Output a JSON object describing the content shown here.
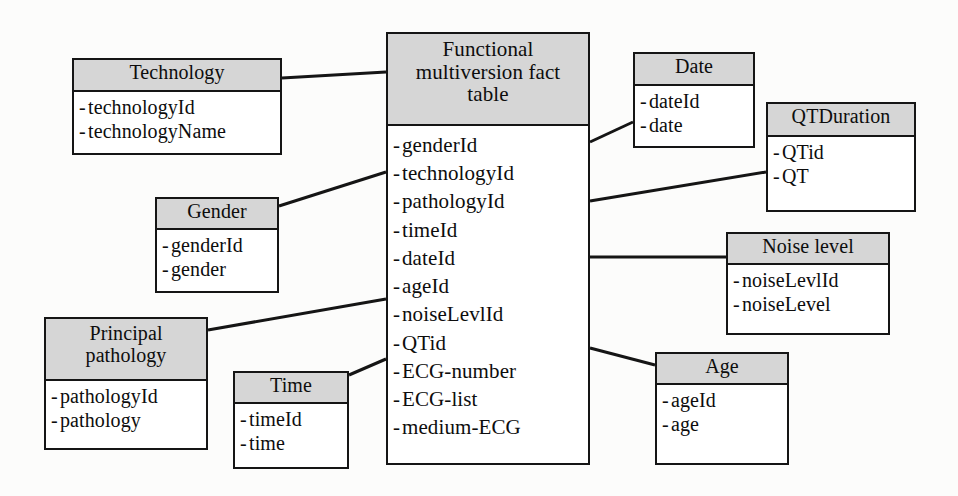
{
  "diagram": {
    "colors": {
      "header_fill": "#d6d6d6",
      "border": "#151515",
      "body_fill": "#ffffff",
      "background": "#fcfcfb",
      "connector": "#151515"
    }
  },
  "fact_table": {
    "name": "fact-table",
    "header_lines": [
      "Functional",
      "multiversion fact",
      "table"
    ],
    "header_text": "Functional multiversion fact table",
    "attributes": [
      "genderId",
      "technologyId",
      "pathologyId",
      "timeId",
      "dateId",
      "ageId",
      "noiseLevlId",
      "QTid",
      "ECG-number",
      "ECG-list",
      "medium-ECG"
    ]
  },
  "dimensions": [
    {
      "key": "technology",
      "header_lines": [
        "Technology"
      ],
      "header_text": "Technology",
      "attributes": [
        "technologyId",
        "technologyName"
      ]
    },
    {
      "key": "gender",
      "header_lines": [
        "Gender"
      ],
      "header_text": "Gender",
      "attributes": [
        "genderId",
        "gender"
      ]
    },
    {
      "key": "principal-pathology",
      "header_lines": [
        "Principal",
        "pathology"
      ],
      "header_text": "Principal pathology",
      "attributes": [
        "pathologyId",
        "pathology"
      ]
    },
    {
      "key": "time",
      "header_lines": [
        "Time"
      ],
      "header_text": "Time",
      "attributes": [
        "timeId",
        "time"
      ]
    },
    {
      "key": "date",
      "header_lines": [
        "Date"
      ],
      "header_text": "Date",
      "attributes": [
        "dateId",
        "date"
      ]
    },
    {
      "key": "qtduration",
      "header_lines": [
        "QTDuration"
      ],
      "header_text": "QTDuration",
      "attributes": [
        "QTid",
        "QT"
      ]
    },
    {
      "key": "noise-level",
      "header_lines": [
        "Noise level"
      ],
      "header_text": "Noise level",
      "attributes": [
        "noiseLevlId",
        "noiseLevel"
      ]
    },
    {
      "key": "age",
      "header_lines": [
        "Age"
      ],
      "header_text": "Age",
      "attributes": [
        "ageId",
        "age"
      ]
    }
  ],
  "connectors": [
    {
      "key": "technology-to-fact",
      "from": "technology",
      "to": "fact_table.header",
      "points": "282,78 386,72"
    },
    {
      "key": "gender-to-fact",
      "from": "gender",
      "to": "fact_table.technologyId",
      "points": "279,206 386,172"
    },
    {
      "key": "principal-pathology-to-fact",
      "from": "principal-pathology",
      "to": "fact_table.ageId",
      "points": "208,330 386,299"
    },
    {
      "key": "time-to-fact",
      "from": "time",
      "to": "fact_table.QTid",
      "points": "349,375 386,359"
    },
    {
      "key": "date-to-fact",
      "from": "date",
      "to": "fact_table.header",
      "points": "590,142 633,122"
    },
    {
      "key": "qtduration-to-fact",
      "from": "qtduration",
      "to": "fact_table.pathologyId",
      "points": "590,201 766,172"
    },
    {
      "key": "noise-level-to-fact",
      "from": "noise-level",
      "to": "fact_table.dateId",
      "points": "590,257 726,257"
    },
    {
      "key": "age-to-fact",
      "from": "age",
      "to": "fact_table.QTid",
      "points": "590,348 655,365"
    }
  ]
}
